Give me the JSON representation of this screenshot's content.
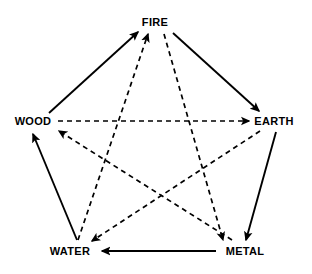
{
  "diagram": {
    "background_color": "#ffffff",
    "line_color": "#000000",
    "nodes": [
      {
        "id": "fire",
        "label": "FIRE",
        "x": 155,
        "y": 22
      },
      {
        "id": "earth",
        "label": "EARTH",
        "x": 274,
        "y": 121
      },
      {
        "id": "metal",
        "label": "METAL",
        "x": 245,
        "y": 251
      },
      {
        "id": "water",
        "label": "WATER",
        "x": 70,
        "y": 251
      },
      {
        "id": "wood",
        "label": "WOOD",
        "x": 33,
        "y": 121
      }
    ],
    "generating_cycle": {
      "name": "generating-cycle",
      "style": "solid",
      "edges": [
        {
          "from": "wood",
          "to": "fire",
          "x1": 49,
          "y1": 113,
          "x2": 138,
          "y2": 32
        },
        {
          "from": "fire",
          "to": "earth",
          "x1": 173,
          "y1": 33,
          "x2": 259,
          "y2": 111
        },
        {
          "from": "earth",
          "to": "metal",
          "x1": 276,
          "y1": 132,
          "x2": 246,
          "y2": 240
        },
        {
          "from": "metal",
          "to": "water",
          "x1": 216,
          "y1": 251,
          "x2": 102,
          "y2": 251
        },
        {
          "from": "water",
          "to": "wood",
          "x1": 77,
          "y1": 240,
          "x2": 33,
          "y2": 134
        }
      ]
    },
    "overcoming_cycle": {
      "name": "overcoming-cycle",
      "style": "dashed",
      "edges": [
        {
          "from": "wood",
          "to": "earth",
          "x1": 58,
          "y1": 121,
          "x2": 249,
          "y2": 121
        },
        {
          "from": "earth",
          "to": "water",
          "x1": 260,
          "y1": 131,
          "x2": 92,
          "y2": 241
        },
        {
          "from": "water",
          "to": "fire",
          "x1": 78,
          "y1": 240,
          "x2": 148,
          "y2": 34
        },
        {
          "from": "fire",
          "to": "metal",
          "x1": 164,
          "y1": 34,
          "x2": 223,
          "y2": 240
        },
        {
          "from": "metal",
          "to": "wood",
          "x1": 232,
          "y1": 240,
          "x2": 59,
          "y2": 131
        }
      ]
    }
  }
}
